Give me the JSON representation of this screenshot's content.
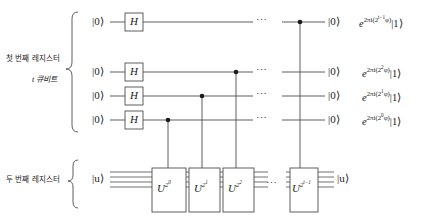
{
  "diagram": {
    "line_color": "#4d4d4d",
    "box_stroke": "#4d4d4d",
    "dot_color": "#1a1a1a",
    "registers": [
      {
        "name": "first-register",
        "label_line1": "첫 번째 레지스터",
        "label_line2": "t 큐비트"
      },
      {
        "name": "second-register",
        "label_line1": "두 번째 레지스터",
        "label_line2": ""
      }
    ],
    "top_wires": [
      {
        "id": "wire-0",
        "input_ket": "|0⟩",
        "gate": "H",
        "output_ket": "|0⟩",
        "out_prefix": "e",
        "out_exp_a": "2πi(2",
        "out_exp_b": "t−1",
        "out_exp_c": "φ)",
        "out_suffix": "|1⟩",
        "ellipsis": "⋯"
      },
      {
        "id": "wire-1",
        "input_ket": "|0⟩",
        "gate": "H",
        "output_ket": "|0⟩",
        "out_prefix": "e",
        "out_exp_a": "2πi(2",
        "out_exp_b": "2",
        "out_exp_c": "φ)",
        "out_suffix": "|1⟩",
        "ellipsis": "⋯"
      },
      {
        "id": "wire-2",
        "input_ket": "|0⟩",
        "gate": "H",
        "output_ket": "|0⟩",
        "out_prefix": "e",
        "out_exp_a": "2πi(2",
        "out_exp_b": "1",
        "out_exp_c": "φ)",
        "out_suffix": "|1⟩",
        "ellipsis": "⋯"
      },
      {
        "id": "wire-3",
        "input_ket": "|0⟩",
        "gate": "H",
        "output_ket": "|0⟩",
        "out_prefix": "e",
        "out_exp_a": "2πi(2",
        "out_exp_b": "0",
        "out_exp_c": "φ)",
        "out_suffix": "|1⟩",
        "ellipsis": "⋯"
      }
    ],
    "bottom_register": {
      "input_ket": "|u⟩",
      "output_ket": "|u⟩",
      "ellipsis": "⋯",
      "gates": [
        {
          "id": "u-gate-0",
          "base": "U",
          "exp_base": "2",
          "exp_sup": "0"
        },
        {
          "id": "u-gate-1",
          "base": "U",
          "exp_base": "2",
          "exp_sup": "1"
        },
        {
          "id": "u-gate-2",
          "base": "U",
          "exp_base": "2",
          "exp_sup": "2"
        },
        {
          "id": "u-gate-last",
          "base": "U",
          "exp_base": "2",
          "exp_sup": "t−1"
        }
      ]
    }
  }
}
